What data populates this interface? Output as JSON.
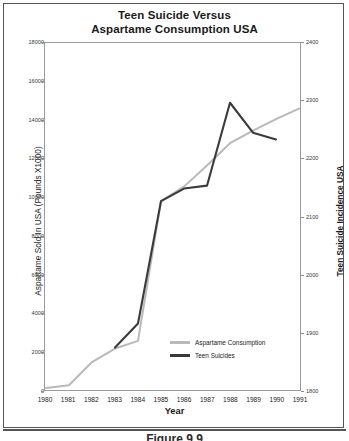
{
  "figure": {
    "caption": "Figure 9.9"
  },
  "chart_data": {
    "type": "line",
    "title": "Teen Suicide Versus Aspartame Consumption USA",
    "title_lines": [
      "Teen Suicide Versus",
      "Aspartame Consumption USA"
    ],
    "xlabel": "Year",
    "ylabel": "Aspartame Sold In USA (Pounds X1000)",
    "ylabel_right": "Teen Suicide Incidence USA",
    "categories": [
      "1980",
      "1981",
      "1982",
      "1983",
      "1984",
      "1985",
      "1986",
      "1987",
      "1988",
      "1989",
      "1990",
      "1991"
    ],
    "x": [
      1980,
      1981,
      1982,
      1983,
      1984,
      1985,
      1986,
      1987,
      1988,
      1989,
      1990,
      1991
    ],
    "ylim": [
      0,
      18000
    ],
    "yticks": [
      0,
      2000,
      4000,
      6000,
      8000,
      10000,
      12000,
      14000,
      16000,
      18000
    ],
    "ylim_right": [
      1800,
      2400
    ],
    "yticks_right": [
      1800,
      1900,
      2000,
      2100,
      2200,
      2300,
      2400
    ],
    "grid": false,
    "legend_position": "inside-lower-right",
    "series": [
      {
        "name": "Aspartame Consumption",
        "axis": "left",
        "color": "#b9b9b9",
        "values": [
          100,
          250,
          1450,
          2150,
          2550,
          9800,
          10550,
          11650,
          12800,
          13450,
          14050,
          14600
        ]
      },
      {
        "name": "Teen Suicides",
        "axis": "right",
        "color": "#3b3b3b",
        "values_left_scale": [
          null,
          null,
          null,
          2200,
          3450,
          9800,
          10450,
          10600,
          14900,
          13350,
          13000,
          null
        ],
        "values": [
          null,
          null,
          null,
          1873,
          1915,
          2127,
          2148,
          2153,
          2297,
          2245,
          2233,
          null
        ]
      }
    ]
  },
  "legend": {
    "items": [
      {
        "label": "Aspartame Consumption",
        "color": "#b9b9b9"
      },
      {
        "label": "Teen Suicides",
        "color": "#3b3b3b"
      }
    ]
  }
}
